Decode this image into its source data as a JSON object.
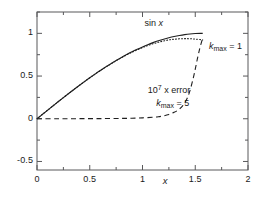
{
  "chart_data": {
    "type": "line",
    "title": "",
    "xlabel": "x",
    "ylabel": "",
    "xlim": [
      0,
      2
    ],
    "ylim": [
      -0.6,
      1.25
    ],
    "grid": false,
    "legend_position": "inline-annotations",
    "xticks": [
      "0",
      "0.5",
      "1",
      "1.5",
      "2"
    ],
    "xtick_values": [
      0,
      0.5,
      1,
      1.5,
      2
    ],
    "xminor_values": [
      0.25,
      0.75,
      1.25,
      1.75
    ],
    "yticks": [
      "1",
      "0.5",
      "0",
      "-0.5"
    ],
    "ytick_values": [
      1,
      0.5,
      0,
      -0.5
    ],
    "yminor_values": [
      1.25,
      0.75,
      0.25,
      -0.25
    ],
    "series": [
      {
        "name": "sin x",
        "style": "solid",
        "x": [
          0,
          0.05,
          0.1,
          0.15,
          0.2,
          0.25,
          0.3,
          0.35,
          0.4,
          0.45,
          0.5,
          0.55,
          0.6,
          0.65,
          0.7,
          0.75,
          0.8,
          0.85,
          0.9,
          0.95,
          1.0,
          1.05,
          1.1,
          1.15,
          1.2,
          1.25,
          1.3,
          1.35,
          1.4,
          1.45,
          1.5,
          1.55,
          1.5708
        ],
        "values": [
          0,
          0.05,
          0.0998,
          0.1494,
          0.1987,
          0.2474,
          0.2955,
          0.3429,
          0.3894,
          0.435,
          0.4794,
          0.5227,
          0.5646,
          0.6052,
          0.6442,
          0.6816,
          0.7174,
          0.7513,
          0.7833,
          0.8134,
          0.8415,
          0.8674,
          0.8912,
          0.9128,
          0.932,
          0.949,
          0.9636,
          0.9757,
          0.9854,
          0.9927,
          0.9975,
          0.9998,
          1.0
        ]
      },
      {
        "name": "k_max = 1",
        "style": "dotted",
        "x": [
          0,
          0.1,
          0.2,
          0.3,
          0.4,
          0.5,
          0.6,
          0.7,
          0.8,
          0.9,
          1.0,
          1.05,
          1.1,
          1.15,
          1.2,
          1.25,
          1.3,
          1.35,
          1.4,
          1.45,
          1.5,
          1.55,
          1.5708
        ],
        "values": [
          0,
          0.0998,
          0.1987,
          0.2955,
          0.3893,
          0.4792,
          0.564,
          0.6427,
          0.7147,
          0.7788,
          0.8333,
          0.857,
          0.878,
          0.896,
          0.911,
          0.923,
          0.931,
          0.936,
          0.938,
          0.937,
          0.933,
          0.9265,
          0.923
        ]
      },
      {
        "name": "10^7 x error, k_max = 5",
        "style": "dashed",
        "x": [
          0,
          0.2,
          0.4,
          0.6,
          0.8,
          0.9,
          1.0,
          1.1,
          1.15,
          1.2,
          1.25,
          1.3,
          1.34,
          1.38,
          1.42,
          1.45,
          1.48,
          1.5,
          1.52,
          1.54,
          1.56,
          1.5708
        ],
        "values": [
          0,
          0.0005,
          0.001,
          0.002,
          0.004,
          0.006,
          0.01,
          0.018,
          0.024,
          0.034,
          0.05,
          0.075,
          0.105,
          0.15,
          0.23,
          0.33,
          0.47,
          0.58,
          0.7,
          0.81,
          0.9,
          0.945
        ]
      }
    ],
    "annotations": [
      {
        "id": "sin-label",
        "text": "sin x",
        "parts": [
          {
            "t": "sin ",
            "style": "normal"
          },
          {
            "t": "x",
            "style": "italic"
          }
        ],
        "x": 1.02,
        "y": 1.105
      },
      {
        "id": "kmax1-label",
        "parts": [
          {
            "t": "k",
            "style": "italic"
          },
          {
            "t": "max",
            "style": "sub"
          },
          {
            "t": " = 1",
            "style": "normal"
          }
        ],
        "x": 1.63,
        "y": 0.845
      },
      {
        "id": "error-label",
        "parts": [
          {
            "t": "10",
            "style": "normal"
          },
          {
            "t": "7",
            "style": "sup"
          },
          {
            "t": " x error",
            "style": "normal"
          }
        ],
        "x": 1.05,
        "y": 0.335
      },
      {
        "id": "kmax5-label",
        "parts": [
          {
            "t": "k",
            "style": "italic"
          },
          {
            "t": "max",
            "style": "sub"
          },
          {
            "t": " = 5",
            "style": "normal"
          }
        ],
        "x": 1.13,
        "y": 0.175
      }
    ]
  },
  "axis": {
    "x_name": "x"
  },
  "colors": {
    "axis": "#58585a",
    "curve": "#1f1f1f",
    "background": "#ffffff"
  }
}
